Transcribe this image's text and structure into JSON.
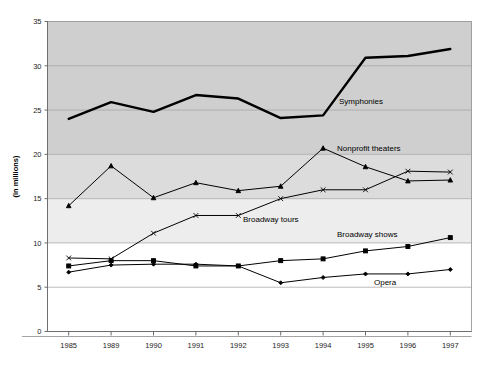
{
  "chart": {
    "title": "",
    "ylabel": "(in millions)",
    "xlabel": ""
  },
  "chart_data": {
    "type": "line",
    "title": "",
    "xlabel": "",
    "ylabel": "(in millions)",
    "ylim": [
      0,
      35
    ],
    "yticks": [
      0,
      5,
      10,
      15,
      20,
      25,
      30,
      35
    ],
    "grid": true,
    "legend_position": "inline-annotations",
    "categories": [
      "1985",
      "1989",
      "1990",
      "1991",
      "1992",
      "1993",
      "1994",
      "1995",
      "1996",
      "1997"
    ],
    "series": [
      {
        "name": "Symphonies",
        "marker": "none",
        "line_weight": "thick",
        "values": [
          24.0,
          25.9,
          24.8,
          26.7,
          26.3,
          24.1,
          24.4,
          30.9,
          31.1,
          31.9
        ]
      },
      {
        "name": "Nonprofit theaters",
        "marker": "triangle",
        "line_weight": "thin",
        "values": [
          14.2,
          18.7,
          15.1,
          16.8,
          15.9,
          16.4,
          20.7,
          18.6,
          17.0,
          17.1
        ]
      },
      {
        "name": "Broadway tours",
        "marker": "cross",
        "line_weight": "thin",
        "values": [
          8.3,
          8.2,
          11.1,
          13.1,
          13.1,
          15.0,
          16.0,
          16.0,
          18.1,
          18.0
        ]
      },
      {
        "name": "Broadway shows",
        "marker": "square",
        "line_weight": "thin",
        "values": [
          7.4,
          8.0,
          8.0,
          7.4,
          7.4,
          8.0,
          8.2,
          9.1,
          9.6,
          10.6
        ]
      },
      {
        "name": "Opera",
        "marker": "diamond",
        "line_weight": "thin",
        "values": [
          6.7,
          7.5,
          7.6,
          7.6,
          7.4,
          5.5,
          6.1,
          6.5,
          6.5,
          7.0
        ]
      }
    ],
    "annotations": [
      {
        "text": "Symphonies",
        "x": 1995,
        "y": 26.3
      },
      {
        "text": "Nonprofit theaters",
        "x": 1995,
        "y": 20.6
      },
      {
        "text": "Broadway tours",
        "x": 1993,
        "y": 13.0
      },
      {
        "text": "Broadway shows",
        "x": 1995,
        "y": 11.6
      },
      {
        "text": "Opera",
        "x": 1996,
        "y": 5.9
      }
    ],
    "colors": {
      "plot_band_high": "#cfcfcf",
      "plot_band_mid": "#dcdcdc",
      "plot_band_low": "#ededed",
      "plot_band_base": "#ffffff",
      "line": "#000000",
      "grid": "#9e9e9e",
      "axis": "#6e6e6e"
    }
  }
}
